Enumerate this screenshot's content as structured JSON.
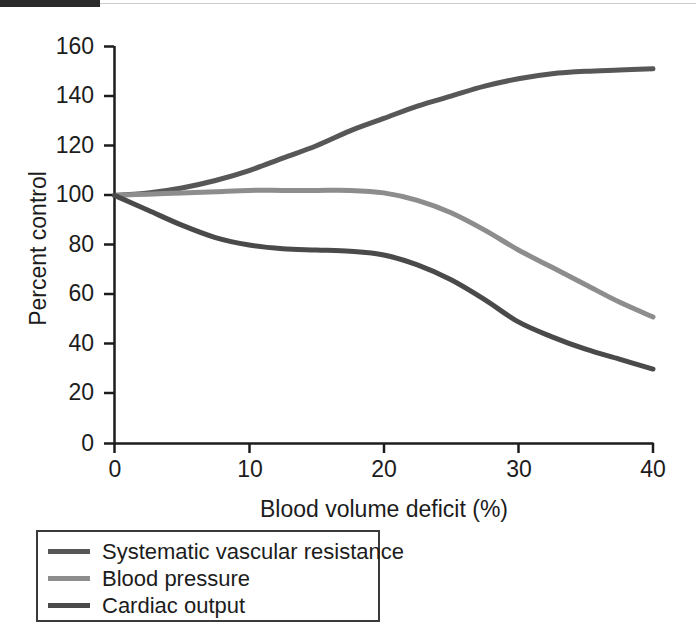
{
  "chart_data": {
    "type": "line",
    "title": "",
    "xlabel": "Blood volume deficit (%)",
    "ylabel": "Percent control",
    "xlim": [
      0,
      40
    ],
    "ylim": [
      0,
      160
    ],
    "xticks": [
      "0",
      "10",
      "20",
      "30",
      "40"
    ],
    "yticks": [
      "0",
      "20",
      "40",
      "60",
      "80",
      "100",
      "120",
      "140",
      "160"
    ],
    "grid": false,
    "legend_position": "below-left",
    "x": [
      0,
      2.5,
      5,
      7.5,
      10,
      12.5,
      15,
      17.5,
      20,
      22.5,
      25,
      27.5,
      30,
      32.5,
      35,
      37.5,
      40
    ],
    "series": [
      {
        "name": "Systematic vascular resistance",
        "color": "#575757",
        "values": [
          100,
          101,
          103,
          106,
          110,
          115,
          120,
          126,
          131,
          136,
          140,
          144,
          147,
          149,
          150,
          150.5,
          151
        ]
      },
      {
        "name": "Blood pressure",
        "color": "#8d8d8d",
        "values": [
          100,
          100.5,
          101,
          101.5,
          102,
          102,
          102,
          102,
          101,
          98,
          93,
          86,
          78,
          71,
          64,
          57,
          51
        ]
      },
      {
        "name": "Cardiac output",
        "color": "#4a4a4a",
        "values": [
          100,
          94,
          88,
          83,
          80,
          78.5,
          78,
          77.5,
          76,
          72,
          66,
          58,
          49,
          43,
          38,
          34,
          30
        ]
      }
    ]
  },
  "legend": {
    "items": [
      {
        "label": "Systematic vascular resistance",
        "color": "#575757"
      },
      {
        "label": "Blood pressure",
        "color": "#8d8d8d"
      },
      {
        "label": "Cardiac output",
        "color": "#4a4a4a"
      }
    ]
  },
  "axes": {
    "y_title": "Percent control",
    "x_title": "Blood volume deficit (%)",
    "y_tick_labels": [
      "160",
      "140",
      "120",
      "100",
      "80",
      "60",
      "40",
      "20",
      "0"
    ],
    "x_tick_labels": [
      "0",
      "10",
      "20",
      "30",
      "40"
    ]
  },
  "colors": {
    "axis": "#1c1c1c",
    "background": "#ffffff",
    "legend_border": "#3a3a3a",
    "scan_bar": "#2b2b2b"
  }
}
